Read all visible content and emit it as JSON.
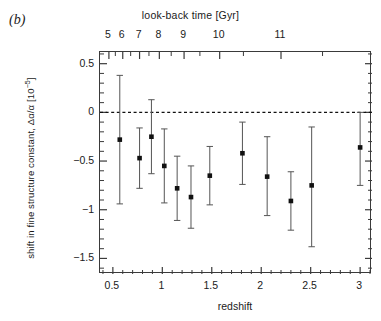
{
  "figure": {
    "panel_label": "(b)",
    "top_axis_title": "look-back time [Gyr]",
    "bottom_axis_title": "redshift",
    "y_axis_title": "shift in fine structure constant, Δα/α [10⁻⁵]",
    "line_color": "#555555",
    "marker_color": "#111111",
    "frame_color": "#3a3a3a",
    "zero_line_style": "dotted"
  },
  "chart_data": {
    "type": "scatter",
    "title": "",
    "xlabel": "redshift",
    "ylabel": "shift in fine structure constant, Δα/α [10^-5]",
    "xlim": [
      0.37,
      3.12
    ],
    "ylim": [
      -1.66,
      0.62
    ],
    "grid": false,
    "legend": null,
    "x_ticks_major": [
      0.5,
      1,
      1.5,
      2,
      2.5,
      3
    ],
    "x_tick_labels": [
      "0.5",
      "1",
      "1.5",
      "2",
      "2.5",
      "3"
    ],
    "x_minor_step": 0.1,
    "y_ticks_major": [
      0.5,
      0,
      -0.5,
      -1,
      -1.5
    ],
    "y_tick_labels": [
      "0.5",
      "0",
      "−0.5",
      "−1",
      "−1.5"
    ],
    "y_minor_step": 0.1,
    "secondary_x_axis": {
      "label": "look-back time [Gyr]",
      "ticks_major": [
        5,
        6,
        7,
        8,
        9,
        10,
        11
      ],
      "tick_labels": [
        "5",
        "6",
        "7",
        "8",
        "9",
        "10",
        "11"
      ],
      "tick_positions_redshift": [
        0.46,
        0.6,
        0.77,
        0.97,
        1.22,
        1.58,
        2.2
      ],
      "minor_tick_positions_redshift": [
        0.525,
        0.68,
        0.865,
        1.09,
        1.38,
        1.82,
        2.62
      ]
    },
    "reference_line": {
      "y": 0,
      "style": "dotted"
    },
    "points": [
      {
        "x": 0.57,
        "y": -0.28,
        "err_low": 0.66,
        "err_high": 0.66
      },
      {
        "x": 0.77,
        "y": -0.47,
        "err_low": 0.31,
        "err_high": 0.31
      },
      {
        "x": 0.89,
        "y": -0.25,
        "err_low": 0.38,
        "err_high": 0.38
      },
      {
        "x": 1.02,
        "y": -0.55,
        "err_low": 0.38,
        "err_high": 0.38
      },
      {
        "x": 1.15,
        "y": -0.78,
        "err_low": 0.33,
        "err_high": 0.33
      },
      {
        "x": 1.29,
        "y": -0.87,
        "err_low": 0.32,
        "err_high": 0.32
      },
      {
        "x": 1.48,
        "y": -0.65,
        "err_low": 0.3,
        "err_high": 0.3
      },
      {
        "x": 1.81,
        "y": -0.42,
        "err_low": 0.32,
        "err_high": 0.32
      },
      {
        "x": 2.06,
        "y": -0.66,
        "err_low": 0.4,
        "err_high": 0.41
      },
      {
        "x": 2.3,
        "y": -0.91,
        "err_low": 0.3,
        "err_high": 0.3
      },
      {
        "x": 2.51,
        "y": -0.75,
        "err_low": 0.63,
        "err_high": 0.6
      },
      {
        "x": 3.0,
        "y": -0.36,
        "err_low": 0.39,
        "err_high": 0.36
      }
    ]
  }
}
